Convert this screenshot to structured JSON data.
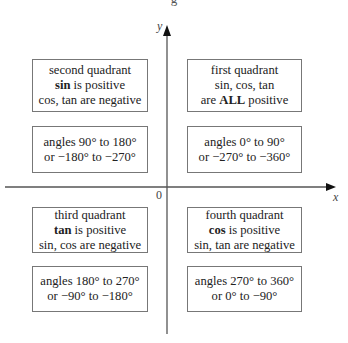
{
  "diagram": {
    "caption_fragment": "g",
    "axes": {
      "x_label": "x",
      "y_label": "y",
      "origin_label": "0"
    },
    "quadrants": {
      "second": {
        "title": "second quadrant",
        "positive_bold": "sin",
        "positive_rest": " is positive",
        "negative": "cos, tan are negative",
        "angles_line1": "angles 90° to 180°",
        "angles_line2": "or −180° to −270°"
      },
      "first": {
        "title": "first quadrant",
        "line2": "sin, cos, tan",
        "line3_pre": "are ",
        "line3_bold": "ALL",
        "line3_post": " positive",
        "angles_line1": "angles 0° to 90°",
        "angles_line2": "or −270° to −360°"
      },
      "third": {
        "title": "third quadrant",
        "positive_bold": "tan",
        "positive_rest": " is positive",
        "negative": "sin, cos are negative",
        "angles_line1": "angles 180° to 270°",
        "angles_line2": "or −90° to −180°"
      },
      "fourth": {
        "title": "fourth quadrant",
        "positive_bold": "cos",
        "positive_rest": " is positive",
        "negative": "sin, tan are negative",
        "angles_line1": "angles 270° to 360°",
        "angles_line2": "or 0° to −90°"
      }
    },
    "colors": {
      "axis": "#555555",
      "box_border": "#777777",
      "text": "#222222"
    }
  }
}
